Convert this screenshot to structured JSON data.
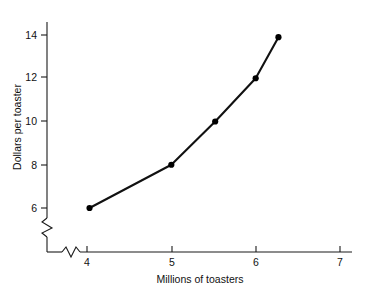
{
  "chart_data": {
    "type": "line",
    "title": "",
    "subtitle": "",
    "xlabel": "Millions of toasters",
    "ylabel": "Dollars per toaster",
    "x": [
      4.03,
      5.0,
      5.52,
      6.0,
      6.27
    ],
    "values": [
      6.0,
      8.0,
      10.0,
      12.0,
      13.9
    ],
    "series": [
      {
        "name": "supply",
        "x": [
          4.03,
          5.0,
          5.52,
          6.0,
          6.27
        ],
        "values": [
          6.0,
          8.0,
          10.0,
          12.0,
          13.9
        ]
      }
    ],
    "xticks": [
      4,
      5,
      6,
      7
    ],
    "xtick_labels": [
      "4",
      "5",
      "6",
      "7"
    ],
    "yticks": [
      6,
      8,
      10,
      12,
      14
    ],
    "ytick_labels": [
      "6",
      "8",
      "10",
      "12",
      "14"
    ],
    "xlim": [
      3.6,
      7.15
    ],
    "ylim": [
      5.3,
      14.6
    ],
    "grid": false,
    "legend": "none",
    "x_axis_break": true,
    "y_axis_break": true,
    "line_color": "#111111",
    "marker_color": "#000000",
    "axis_color": "#1a1a1a",
    "background_color": "#ffffff"
  },
  "labels": {
    "y_axis_title": "Dollars per toaster",
    "x_axis_title": "Millions of toasters",
    "ytick_6": "6",
    "ytick_8": "8",
    "ytick_10": "10",
    "ytick_12": "12",
    "ytick_14": "14",
    "xtick_4": "4",
    "xtick_5": "5",
    "xtick_6": "6",
    "xtick_7": "7"
  }
}
